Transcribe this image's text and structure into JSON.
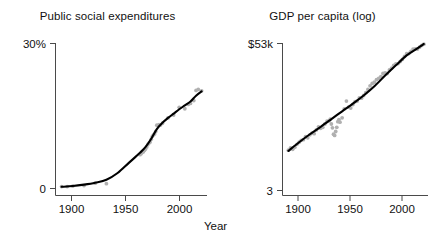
{
  "figure": {
    "shared_xlabel": "Year",
    "accent_point_color": "#b0b0b0",
    "accent_line_color": "#000000",
    "axis_color": "#4a4a4a"
  },
  "chart_data": [
    {
      "type": "scatter",
      "panel_index": 0,
      "title": "Public social expenditures",
      "xlabel": "Year",
      "ylabel": "",
      "xlim": [
        1885,
        2018
      ],
      "ylim": [
        0,
        30
      ],
      "grid": false,
      "legend": null,
      "xticks": [
        1900,
        1950,
        2000
      ],
      "xtick_labels": [
        "1900",
        "1950",
        "2000"
      ],
      "yticks": [
        0,
        30
      ],
      "ytick_labels": [
        "0",
        "30%"
      ],
      "points": [
        {
          "x": 1890,
          "y": 0.4
        },
        {
          "x": 1895,
          "y": 0.4
        },
        {
          "x": 1900,
          "y": 0.5
        },
        {
          "x": 1910,
          "y": 0.6
        },
        {
          "x": 1920,
          "y": 1.1
        },
        {
          "x": 1930,
          "y": 1.0
        },
        {
          "x": 1960,
          "y": 7.0
        },
        {
          "x": 1961,
          "y": 7.2
        },
        {
          "x": 1962,
          "y": 7.5
        },
        {
          "x": 1963,
          "y": 7.6
        },
        {
          "x": 1964,
          "y": 7.9
        },
        {
          "x": 1965,
          "y": 8.2
        },
        {
          "x": 1966,
          "y": 8.6
        },
        {
          "x": 1967,
          "y": 9.1
        },
        {
          "x": 1968,
          "y": 9.4
        },
        {
          "x": 1969,
          "y": 9.6
        },
        {
          "x": 1970,
          "y": 10.2
        },
        {
          "x": 1971,
          "y": 10.8
        },
        {
          "x": 1972,
          "y": 11.1
        },
        {
          "x": 1973,
          "y": 11.3
        },
        {
          "x": 1974,
          "y": 11.8
        },
        {
          "x": 1975,
          "y": 13.1
        },
        {
          "x": 1976,
          "y": 13.0
        },
        {
          "x": 1977,
          "y": 13.2
        },
        {
          "x": 1978,
          "y": 13.1
        },
        {
          "x": 1980,
          "y": 13.5
        },
        {
          "x": 1985,
          "y": 14.6
        },
        {
          "x": 1990,
          "y": 15.2
        },
        {
          "x": 1995,
          "y": 16.8
        },
        {
          "x": 2000,
          "y": 16.5
        },
        {
          "x": 2003,
          "y": 17.4
        },
        {
          "x": 2005,
          "y": 17.6
        },
        {
          "x": 2008,
          "y": 18.2
        },
        {
          "x": 2010,
          "y": 20.3
        },
        {
          "x": 2012,
          "y": 20.5
        },
        {
          "x": 2015,
          "y": 20.2
        }
      ],
      "fit_curve": [
        {
          "x": 1890,
          "y": 0.35
        },
        {
          "x": 1900,
          "y": 0.5
        },
        {
          "x": 1910,
          "y": 0.8
        },
        {
          "x": 1920,
          "y": 1.2
        },
        {
          "x": 1930,
          "y": 1.8
        },
        {
          "x": 1940,
          "y": 3.2
        },
        {
          "x": 1950,
          "y": 5.3
        },
        {
          "x": 1960,
          "y": 7.4
        },
        {
          "x": 1965,
          "y": 8.6
        },
        {
          "x": 1970,
          "y": 10.3
        },
        {
          "x": 1975,
          "y": 12.3
        },
        {
          "x": 1980,
          "y": 13.6
        },
        {
          "x": 1985,
          "y": 14.6
        },
        {
          "x": 1990,
          "y": 15.5
        },
        {
          "x": 1995,
          "y": 16.4
        },
        {
          "x": 2000,
          "y": 17.2
        },
        {
          "x": 2005,
          "y": 18.0
        },
        {
          "x": 2010,
          "y": 19.2
        },
        {
          "x": 2015,
          "y": 20.1
        }
      ]
    },
    {
      "type": "scatter",
      "panel_index": 1,
      "title": "GDP per capita (log)",
      "xlabel": "Year",
      "ylabel": "",
      "xlim": [
        1885,
        2018
      ],
      "ylim": [
        3,
        53
      ],
      "y_scale": "log",
      "grid": false,
      "legend": null,
      "xticks": [
        1900,
        1950,
        2000
      ],
      "xtick_labels": [
        "1900",
        "1950",
        "2000"
      ],
      "yticks": [
        3,
        53
      ],
      "ytick_labels": [
        "3",
        "$53k"
      ],
      "points": [
        {
          "x": 1890,
          "y": 6.6
        },
        {
          "x": 1892,
          "y": 6.9
        },
        {
          "x": 1894,
          "y": 6.7
        },
        {
          "x": 1896,
          "y": 7.0
        },
        {
          "x": 1898,
          "y": 7.4
        },
        {
          "x": 1900,
          "y": 7.7
        },
        {
          "x": 1902,
          "y": 8.0
        },
        {
          "x": 1904,
          "y": 8.1
        },
        {
          "x": 1906,
          "y": 8.6
        },
        {
          "x": 1908,
          "y": 8.4
        },
        {
          "x": 1910,
          "y": 8.9
        },
        {
          "x": 1912,
          "y": 9.2
        },
        {
          "x": 1914,
          "y": 9.1
        },
        {
          "x": 1916,
          "y": 9.8
        },
        {
          "x": 1918,
          "y": 10.4
        },
        {
          "x": 1920,
          "y": 10.1
        },
        {
          "x": 1922,
          "y": 10.3
        },
        {
          "x": 1924,
          "y": 11.0
        },
        {
          "x": 1926,
          "y": 11.6
        },
        {
          "x": 1928,
          "y": 11.7
        },
        {
          "x": 1929,
          "y": 12.1
        },
        {
          "x": 1930,
          "y": 11.0
        },
        {
          "x": 1931,
          "y": 10.2
        },
        {
          "x": 1932,
          "y": 9.0
        },
        {
          "x": 1933,
          "y": 8.8
        },
        {
          "x": 1934,
          "y": 9.5
        },
        {
          "x": 1935,
          "y": 10.3
        },
        {
          "x": 1936,
          "y": 11.5
        },
        {
          "x": 1937,
          "y": 12.0
        },
        {
          "x": 1938,
          "y": 11.4
        },
        {
          "x": 1940,
          "y": 12.4
        },
        {
          "x": 1942,
          "y": 14.8
        },
        {
          "x": 1944,
          "y": 17.2
        },
        {
          "x": 1946,
          "y": 15.3
        },
        {
          "x": 1948,
          "y": 15.0
        },
        {
          "x": 1950,
          "y": 16.1
        },
        {
          "x": 1952,
          "y": 17.0
        },
        {
          "x": 1954,
          "y": 17.2
        },
        {
          "x": 1956,
          "y": 18.3
        },
        {
          "x": 1958,
          "y": 18.2
        },
        {
          "x": 1960,
          "y": 19.2
        },
        {
          "x": 1962,
          "y": 20.3
        },
        {
          "x": 1964,
          "y": 21.6
        },
        {
          "x": 1966,
          "y": 23.2
        },
        {
          "x": 1968,
          "y": 24.3
        },
        {
          "x": 1970,
          "y": 24.9
        },
        {
          "x": 1972,
          "y": 26.2
        },
        {
          "x": 1974,
          "y": 26.8
        },
        {
          "x": 1976,
          "y": 27.8
        },
        {
          "x": 1978,
          "y": 29.5
        },
        {
          "x": 1980,
          "y": 29.9
        },
        {
          "x": 1982,
          "y": 29.5
        },
        {
          "x": 1984,
          "y": 31.6
        },
        {
          "x": 1986,
          "y": 32.8
        },
        {
          "x": 1988,
          "y": 34.6
        },
        {
          "x": 1990,
          "y": 35.6
        },
        {
          "x": 1992,
          "y": 35.8
        },
        {
          "x": 1994,
          "y": 37.3
        },
        {
          "x": 1996,
          "y": 38.8
        },
        {
          "x": 1998,
          "y": 41.1
        },
        {
          "x": 2000,
          "y": 43.4
        },
        {
          "x": 2002,
          "y": 43.6
        },
        {
          "x": 2004,
          "y": 45.5
        },
        {
          "x": 2006,
          "y": 47.5
        },
        {
          "x": 2008,
          "y": 47.8
        },
        {
          "x": 2010,
          "y": 47.6
        },
        {
          "x": 2012,
          "y": 49.3
        },
        {
          "x": 2014,
          "y": 51.0
        },
        {
          "x": 2016,
          "y": 52.3
        }
      ],
      "fit_curve": [
        {
          "x": 1890,
          "y": 6.5
        },
        {
          "x": 1900,
          "y": 7.7
        },
        {
          "x": 1910,
          "y": 9.0
        },
        {
          "x": 1920,
          "y": 10.4
        },
        {
          "x": 1930,
          "y": 12.1
        },
        {
          "x": 1940,
          "y": 14.1
        },
        {
          "x": 1950,
          "y": 16.4
        },
        {
          "x": 1960,
          "y": 19.2
        },
        {
          "x": 1970,
          "y": 23.0
        },
        {
          "x": 1980,
          "y": 28.3
        },
        {
          "x": 1990,
          "y": 34.6
        },
        {
          "x": 2000,
          "y": 42.0
        },
        {
          "x": 2010,
          "y": 48.2
        },
        {
          "x": 2016,
          "y": 52.5
        }
      ]
    }
  ]
}
